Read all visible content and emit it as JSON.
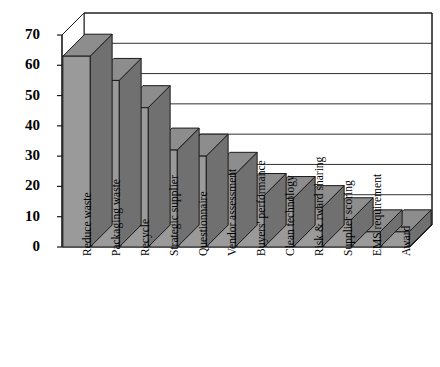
{
  "chart_data": {
    "type": "bar",
    "title": "",
    "subtitle": "",
    "xlabel": "",
    "ylabel": "",
    "ylim": [
      0,
      70
    ],
    "yticks": [
      0,
      10,
      20,
      30,
      40,
      50,
      60,
      70
    ],
    "grid": true,
    "legend": false,
    "three_d": true,
    "bar_color": "#9a9a9a",
    "bar_top_color": "#8d8d8d",
    "bar_side_color": "#707070",
    "categories": [
      "Reduce waste",
      "Packaging waste",
      "Recycle",
      "Strategic supplier",
      "Questionnaire",
      "Vendor assessment",
      "Buyers' performance",
      "Clean technology",
      "Risk & rward sharing",
      "Supplier scoring",
      "EMS requirement",
      "Award"
    ],
    "values": [
      63,
      55,
      46,
      32,
      30,
      24,
      17,
      16,
      13,
      9,
      5,
      5
    ]
  },
  "axis": {
    "y_tick_labels": [
      "70",
      "60",
      "50",
      "40",
      "30",
      "20",
      "10",
      "0"
    ]
  }
}
